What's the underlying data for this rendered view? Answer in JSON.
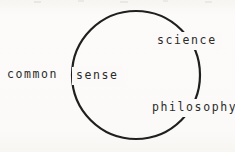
{
  "figure": {
    "kind": "venn-single-circle-diagram",
    "width": 235,
    "height": 152,
    "background_color": "#fbfaf8",
    "ink_color": "#2b2b2b"
  },
  "circle": {
    "center_x": 136,
    "center_y": 75,
    "radius": 64,
    "stroke_color": "#1f1f1f",
    "stroke_width": 2.2
  },
  "labels": {
    "common": "common",
    "sense": "sense",
    "science": "science",
    "philosophy": "philosophy"
  },
  "diagram_data": {
    "type": "venn",
    "title": "",
    "sets": [
      {
        "name": "common sense",
        "label": "common sense",
        "position": "left",
        "shape": "text-spanning-boundary",
        "inside_circle": false
      }
    ],
    "annotations": [
      {
        "text": "common sense",
        "x": 8,
        "y": 80,
        "placement": "left-crossing-boundary",
        "on_arc": true
      },
      {
        "text": "science",
        "x": 157,
        "y": 46,
        "placement": "upper-right-on-arc",
        "on_arc": true
      },
      {
        "text": "philosophy",
        "x": 152,
        "y": 113,
        "placement": "lower-right-on-arc",
        "on_arc": true
      }
    ]
  }
}
